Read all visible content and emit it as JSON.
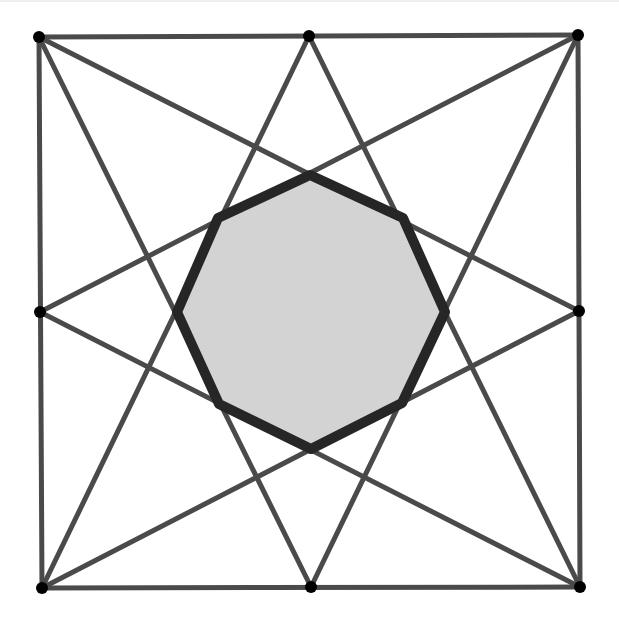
{
  "diagram": {
    "type": "geometric-construction",
    "colors": {
      "background": "#ffffff",
      "line": "#4a4a4a",
      "octagon_stroke": "#262626",
      "octagon_fill": "#d3d3d3",
      "point": "#000000"
    },
    "points": [
      {
        "id": "TL",
        "x": 39,
        "y": 37
      },
      {
        "id": "TM",
        "x": 309,
        "y": 36
      },
      {
        "id": "TR",
        "x": 578,
        "y": 35
      },
      {
        "id": "ML",
        "x": 40,
        "y": 312
      },
      {
        "id": "MR",
        "x": 579,
        "y": 311
      },
      {
        "id": "BL",
        "x": 42,
        "y": 588
      },
      {
        "id": "BM",
        "x": 311,
        "y": 587
      },
      {
        "id": "BR",
        "x": 580,
        "y": 587
      }
    ],
    "square_edges": [
      [
        "TL",
        "TR"
      ],
      [
        "TR",
        "BR"
      ],
      [
        "BR",
        "BL"
      ],
      [
        "BL",
        "TL"
      ]
    ],
    "star_lines": [
      [
        "TL",
        "MR"
      ],
      [
        "TL",
        "BM"
      ],
      [
        "TR",
        "ML"
      ],
      [
        "TR",
        "BM"
      ],
      [
        "BL",
        "TM"
      ],
      [
        "BL",
        "MR"
      ],
      [
        "BR",
        "TM"
      ],
      [
        "BR",
        "ML"
      ]
    ],
    "octagon": [
      {
        "x": 310,
        "y": 175
      },
      {
        "x": 403,
        "y": 218
      },
      {
        "x": 445,
        "y": 312
      },
      {
        "x": 402,
        "y": 403
      },
      {
        "x": 311,
        "y": 449
      },
      {
        "x": 219,
        "y": 404
      },
      {
        "x": 177,
        "y": 312
      },
      {
        "x": 218,
        "y": 218
      }
    ],
    "point_radius": 6,
    "line_width": 5,
    "octagon_stroke_width": 10
  }
}
